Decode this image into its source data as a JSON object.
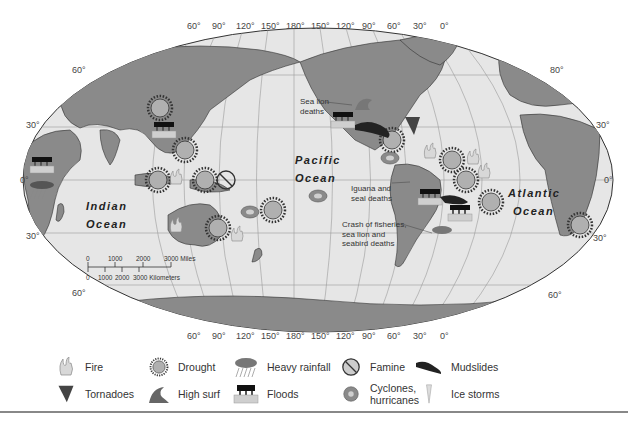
{
  "map": {
    "projection": "Robinson",
    "longitude_ticks_top": [
      "60°",
      "90°",
      "120°",
      "150°",
      "180°",
      "150°",
      "120°",
      "90°",
      "60°",
      "30°",
      "0°"
    ],
    "longitude_ticks_bottom": [
      "60°",
      "90°",
      "120°",
      "150°",
      "180°",
      "150°",
      "120°",
      "90°",
      "60°",
      "30°",
      "0°"
    ],
    "latitude_ticks_left": [
      "60°",
      "30°",
      "0°",
      "30°",
      "60°"
    ],
    "latitude_ticks_right": [
      "80°",
      "30°",
      "0°",
      "30°",
      "60°"
    ],
    "oceans": {
      "indian_line1": "Indian",
      "indian_line2": "Ocean",
      "pacific_line1": "Pacific",
      "pacific_line2": "Ocean",
      "atlantic_line1": "Atlantic",
      "atlantic_line2": "Ocean"
    },
    "annotations": {
      "sea_lion_line1": "Sea lion",
      "sea_lion_line2": "deaths",
      "iguana_line1": "Iguana and",
      "iguana_line2": "seal deaths",
      "crash_line1": "Crash of fisheries,",
      "crash_line2": "sea lion and",
      "crash_line3": "seabird deaths"
    },
    "scale_bar": {
      "miles_labels": [
        "0",
        "1000",
        "2000",
        "3000 Miles"
      ],
      "km_labels": [
        "0",
        "1000",
        "2000",
        "3000 Kilometers"
      ]
    },
    "colors": {
      "ocean": "#e6e6e6",
      "land": "#8a8a8a",
      "grid": "#9a9a9a",
      "outline": "#333333"
    }
  },
  "legend": {
    "items": [
      {
        "label": "Fire",
        "icon": "fire-icon"
      },
      {
        "label": "Drought",
        "icon": "drought-icon"
      },
      {
        "label": "Heavy rainfall",
        "icon": "heavy-rainfall-icon"
      },
      {
        "label": "Famine",
        "icon": "famine-icon"
      },
      {
        "label": "Mudslides",
        "icon": "mudslides-icon"
      },
      {
        "label": "Tornadoes",
        "icon": "tornado-icon"
      },
      {
        "label": "High surf",
        "icon": "high-surf-icon"
      },
      {
        "label": "Floods",
        "icon": "floods-icon"
      },
      {
        "label": "Cyclones,",
        "label2": "hurricanes",
        "icon": "cyclone-icon"
      },
      {
        "label": "Ice storms",
        "icon": "ice-storm-icon"
      }
    ]
  }
}
